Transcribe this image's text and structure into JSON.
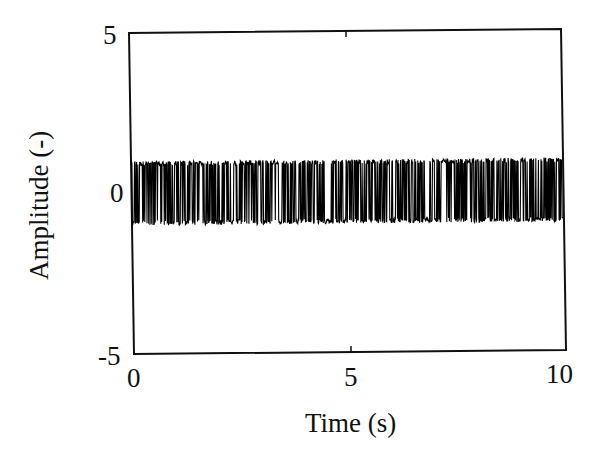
{
  "chart_data": {
    "type": "line",
    "title": "",
    "xlabel": "Time (s)",
    "ylabel": "Amplitude (-)",
    "xlim": [
      0,
      10
    ],
    "ylim": [
      -5,
      5
    ],
    "x_ticks": [
      0,
      5,
      10
    ],
    "x_tick_labels": [
      "0",
      "5",
      "10"
    ],
    "y_ticks": [
      -5,
      0,
      5
    ],
    "y_tick_labels": [
      "-5",
      "0",
      "5"
    ],
    "grid": false,
    "legend": null,
    "series": [
      {
        "name": "pseudo-random binary signal",
        "description": "Random binary (telegraph-like) signal switching between +1 and -1 over 0-10 s",
        "levels": [
          -1,
          1
        ],
        "t_start": 0,
        "t_end": 10,
        "approx_samples": 1000,
        "color": "#000000"
      }
    ]
  },
  "labels": {
    "xlabel": "Time (s)",
    "ylabel": "Amplitude (-)",
    "xtick_0": "0",
    "xtick_5": "5",
    "xtick_10": "10",
    "ytick_5": "5",
    "ytick_0": "0",
    "ytick_m5": "-5"
  },
  "colors": {
    "axes": "#111111",
    "signal": "#000000",
    "background": "#ffffff"
  }
}
